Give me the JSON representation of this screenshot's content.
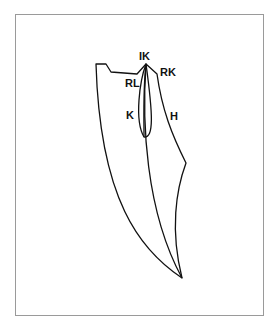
{
  "diagram": {
    "labels": {
      "ik": "IK",
      "rk": "RK",
      "rl": "RL",
      "k": "K",
      "h": "H"
    },
    "stroke_color": "#111111",
    "frame_color": "#9a9a9a"
  }
}
